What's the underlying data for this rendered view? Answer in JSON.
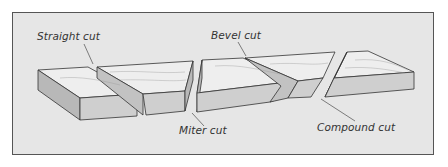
{
  "diagram": {
    "type": "illustration",
    "labels": [
      {
        "id": "straight",
        "text": "Straight cut"
      },
      {
        "id": "bevel",
        "text": "Bevel cut"
      },
      {
        "id": "miter",
        "text": "Miter cut"
      },
      {
        "id": "compound",
        "text": "Compound cut"
      }
    ],
    "colors": {
      "panel_bg": "#e6e6e6",
      "board_top": "#eeeeee",
      "board_front": "#cfcfcf",
      "board_side": "#b8b8b8",
      "outline": "#333333"
    }
  }
}
